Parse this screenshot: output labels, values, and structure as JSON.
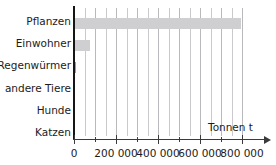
{
  "chart_data": {
    "type": "bar",
    "orientation": "horizontal",
    "title": "",
    "xlabel": "Tonnen t",
    "ylabel": "",
    "categories": [
      "Pflanzen",
      "Einwohner",
      "Regenwürmer",
      "andere Tiere",
      "Hunde",
      "Katzen"
    ],
    "values": [
      795000,
      76000,
      9000,
      3000,
      0,
      0
    ],
    "xlim": [
      0,
      850000
    ],
    "xticks": [
      0,
      100000,
      200000,
      300000,
      400000,
      500000,
      600000,
      700000,
      800000
    ],
    "xtick_labels": [
      "0",
      "",
      "200 000",
      "",
      "400 000",
      "",
      "600 000",
      "",
      "800 000"
    ],
    "grid": true,
    "grid_axis": "x",
    "grid_step": 50000,
    "legend": "none",
    "bar_color": "#cfcfd2",
    "grid_color": "#b9b9bd",
    "axis_color": "#3a3a3a"
  },
  "axis": {
    "x_title": "Tonnen t",
    "arrow": "right-arrow-icon"
  },
  "categories": [
    {
      "label": "Pflanzen",
      "value": 795000
    },
    {
      "label": "Einwohner",
      "value": 76000
    },
    {
      "label": "Regenwürmer",
      "value": 9000
    },
    {
      "label": "andere Tiere",
      "value": 3000
    },
    {
      "label": "Hunde",
      "value": 0
    },
    {
      "label": "Katzen",
      "value": 0
    }
  ],
  "ticks": [
    {
      "value": 0,
      "label": "0"
    },
    {
      "value": 100000,
      "label": ""
    },
    {
      "value": 200000,
      "label": "200 000"
    },
    {
      "value": 300000,
      "label": ""
    },
    {
      "value": 400000,
      "label": "400 000"
    },
    {
      "value": 500000,
      "label": ""
    },
    {
      "value": 600000,
      "label": "600 000"
    },
    {
      "value": 700000,
      "label": ""
    },
    {
      "value": 800000,
      "label": "800 000"
    }
  ]
}
